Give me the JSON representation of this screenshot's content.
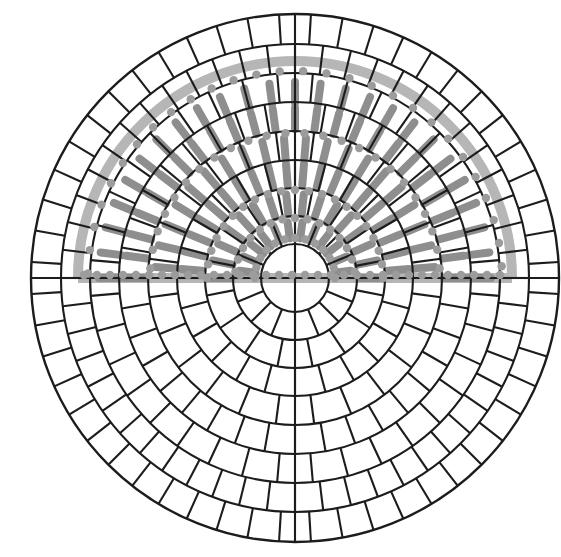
{
  "figure": {
    "canvas": {
      "width": 561,
      "height": 557,
      "background": "#ffffff"
    },
    "center": {
      "x": 295,
      "y": 278
    },
    "mesh": {
      "stroke": "#1c1c1c",
      "stroke_width": 2.1,
      "outer_stroke_width": 2.4,
      "ring_radii": [
        34,
        62,
        90,
        118,
        147,
        176,
        205,
        234,
        264
      ],
      "ring_sectors": [
        16,
        16,
        24,
        24,
        36,
        36,
        52,
        52
      ],
      "ring_phase_deg": [
        0,
        11.25,
        0,
        7.5,
        0,
        5,
        0,
        3.4615
      ],
      "has_full_diameters": true
    },
    "overlay": {
      "half": "top",
      "band_color": "#b6b6b6",
      "band_width": 10,
      "band_radius": 217,
      "rod_color": "#8e8e8e",
      "rod_width": 8,
      "dot_color": "#9c9c9c",
      "dot_radius": 4.2,
      "rod_bands": [
        {
          "r0": 40,
          "r1": 56,
          "pitch_deg": 15,
          "phase_deg": 7.5
        },
        {
          "r0": 64,
          "r1": 84,
          "pitch_deg": 12,
          "phase_deg": 0
        },
        {
          "r0": 93,
          "r1": 114,
          "pitch_deg": 9,
          "phase_deg": 4.5
        },
        {
          "r0": 119,
          "r1": 140,
          "pitch_deg": 9,
          "phase_deg": 4.5
        },
        {
          "r0": 149,
          "r1": 170,
          "pitch_deg": 7.5,
          "phase_deg": 0
        },
        {
          "r0": 175,
          "r1": 196,
          "pitch_deg": 7.5,
          "phase_deg": 0
        }
      ],
      "dot_rows": [
        {
          "radius": 40,
          "pitch_deg": 15,
          "phase_deg": 0
        },
        {
          "radius": 60,
          "pitch_deg": 12,
          "phase_deg": 6
        },
        {
          "radius": 88,
          "pitch_deg": 9,
          "phase_deg": 0
        },
        {
          "radius": 145,
          "pitch_deg": 7.5,
          "phase_deg": 3.75
        },
        {
          "radius": 207,
          "pitch_deg": 6.5,
          "phase_deg": 3.25
        }
      ],
      "baseline_dots": {
        "y_offset": -3,
        "x_step": 13,
        "half_extent": 211
      }
    }
  }
}
